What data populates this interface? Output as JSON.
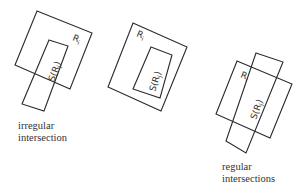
{
  "figures": [
    {
      "id": "irregular",
      "outer": {
        "label": "R",
        "subscript": "i",
        "points": "37,11 92,33 70,89 15,65"
      },
      "inner": {
        "label": "S(R",
        "subscript": "j",
        "close": ")",
        "full_label": "S(Rj)",
        "points": "49,40 68,46 44,111 22,104"
      },
      "caption": [
        "irregular",
        "intersection"
      ]
    },
    {
      "id": "contained",
      "outer": {
        "label": "R",
        "subscript": "i",
        "points": "133,23 187,47 161,111 108,87"
      },
      "inner": {
        "label": "S(R",
        "subscript": "j",
        "close": ")",
        "full_label": "S(Rj)",
        "points": "151,47 172,55 160,98 133,89"
      },
      "caption": []
    },
    {
      "id": "regular",
      "outer": {
        "label": "R",
        "subscript": "i",
        "points": "237,61 292,84 270,138 216,114"
      },
      "inner": {
        "label": "S(R",
        "subscript": "j",
        "close": ")",
        "full_label": "S(Rj)",
        "points": "256,53 283,62 246,153 226,141"
      },
      "caption": [
        "regular",
        "intersections"
      ]
    }
  ],
  "colors": {
    "stroke": "#2a2a2a",
    "text": "#333333",
    "background": "#ffffff"
  }
}
